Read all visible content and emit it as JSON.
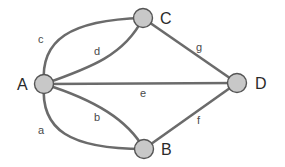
{
  "diagram": {
    "type": "graph",
    "nodes": [
      {
        "id": "A",
        "label": "A"
      },
      {
        "id": "B",
        "label": "B"
      },
      {
        "id": "C",
        "label": "C"
      },
      {
        "id": "D",
        "label": "D"
      }
    ],
    "edges": [
      {
        "label": "a",
        "from": "A",
        "to": "B"
      },
      {
        "label": "b",
        "from": "A",
        "to": "B"
      },
      {
        "label": "c",
        "from": "A",
        "to": "C"
      },
      {
        "label": "d",
        "from": "A",
        "to": "C"
      },
      {
        "label": "e",
        "from": "A",
        "to": "D"
      },
      {
        "label": "f",
        "from": "B",
        "to": "D"
      },
      {
        "label": "g",
        "from": "C",
        "to": "D"
      }
    ],
    "colors": {
      "node_fill": "#c8c8c8",
      "node_stroke": "#555555",
      "edge": "#6b6b6b",
      "text": "#2a2a2a"
    }
  }
}
